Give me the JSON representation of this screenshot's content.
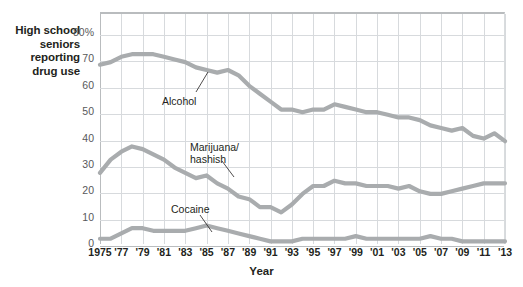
{
  "axis_caption": "High school\nseniors\nreporting\ndrug use",
  "xlabel": "Year",
  "colors": {
    "line": "#a9acae",
    "grid": "#d7dadd",
    "frame": "#b9bcbe",
    "text": "#231f20",
    "tick_text": "#58595b"
  },
  "annotations": [
    {
      "name": "alcohol",
      "text": "Alcohol",
      "x": 162,
      "y": 95,
      "leader": {
        "x1": 196,
        "y1": 92,
        "x2": 208,
        "y2": 72
      }
    },
    {
      "name": "marijuana",
      "text": "Marijuana/\nhashish",
      "x": 190,
      "y": 141,
      "leader": {
        "x1": 222,
        "y1": 161,
        "x2": 234,
        "y2": 177
      }
    },
    {
      "name": "cocaine",
      "text": "Cocaine",
      "x": 171,
      "y": 203,
      "leader": {
        "x1": 200,
        "y1": 215,
        "x2": 212,
        "y2": 232
      }
    }
  ],
  "chart_data": {
    "type": "line",
    "title": "",
    "xlabel": "Year",
    "ylabel": "High school seniors reporting drug use",
    "ylim": [
      0,
      88
    ],
    "xlim": [
      1975,
      2013
    ],
    "yticks": [
      0,
      10,
      20,
      30,
      40,
      50,
      60,
      70,
      80
    ],
    "ytick_labels": [
      "0",
      "10",
      "20",
      "30",
      "40",
      "50",
      "60",
      "70",
      "80%"
    ],
    "xticks": [
      1975,
      1977,
      1979,
      1981,
      1983,
      1985,
      1987,
      1989,
      1991,
      1993,
      1995,
      1997,
      1999,
      2001,
      2003,
      2005,
      2007,
      2009,
      2011,
      2013
    ],
    "xtick_labels": [
      "1975",
      "'77",
      "'79",
      "'81",
      "'83",
      "'85",
      "'87",
      "'89",
      "'91",
      "'93",
      "'95",
      "'97",
      "'99",
      "'01",
      "'03",
      "'05",
      "'07",
      "'09",
      "'11",
      "'13"
    ],
    "grid": true,
    "legend": "inline-annotations",
    "x": [
      1975,
      1976,
      1977,
      1978,
      1979,
      1980,
      1981,
      1982,
      1983,
      1984,
      1985,
      1986,
      1987,
      1988,
      1989,
      1990,
      1991,
      1992,
      1993,
      1994,
      1995,
      1996,
      1997,
      1998,
      1999,
      2000,
      2001,
      2002,
      2003,
      2004,
      2005,
      2006,
      2007,
      2008,
      2009,
      2010,
      2011,
      2012,
      2013
    ],
    "series": [
      {
        "name": "Alcohol",
        "values": [
          68,
          69,
          71,
          72,
          72,
          72,
          71,
          70,
          69,
          67,
          66,
          65,
          66,
          64,
          60,
          57,
          54,
          51,
          51,
          50,
          51,
          51,
          53,
          52,
          51,
          50,
          50,
          49,
          48,
          48,
          47,
          45,
          44,
          43,
          44,
          41,
          40,
          42,
          39
        ]
      },
      {
        "name": "Marijuana/hashish",
        "values": [
          27,
          32,
          35,
          37,
          36,
          34,
          32,
          29,
          27,
          25,
          26,
          23,
          21,
          18,
          17,
          14,
          14,
          12,
          15,
          19,
          22,
          22,
          24,
          23,
          23,
          22,
          22,
          22,
          21,
          22,
          20,
          19,
          19,
          20,
          21,
          22,
          23,
          23,
          23
        ]
      },
      {
        "name": "Cocaine",
        "values": [
          2,
          2,
          4,
          6,
          6,
          5,
          5,
          5,
          5,
          6,
          7,
          6,
          5,
          4,
          3,
          2,
          1,
          1,
          1,
          2,
          2,
          2,
          2,
          2,
          3,
          2,
          2,
          2,
          2,
          2,
          2,
          3,
          2,
          2,
          1,
          1,
          1,
          1,
          1
        ]
      }
    ]
  }
}
